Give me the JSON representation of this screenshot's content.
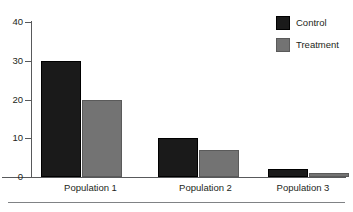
{
  "chart_data": {
    "type": "bar",
    "title": "",
    "subtitle": "",
    "xlabel": "",
    "ylabel": "",
    "categories": [
      "Population 1",
      "Population 2",
      "Population 3"
    ],
    "series": [
      {
        "name": "Control",
        "color": "#1a1a1a",
        "values": [
          30,
          10,
          2
        ]
      },
      {
        "name": "Treatment",
        "color": "#737373",
        "values": [
          20,
          7,
          1
        ]
      }
    ],
    "ylim": [
      0,
      40
    ],
    "yticks": [
      0,
      10,
      20,
      30,
      40
    ],
    "ytick_labels": [
      "0",
      "10",
      "20",
      "30",
      "40"
    ],
    "grid": false,
    "legend_position": "top-right",
    "annotations": []
  },
  "legend": {
    "entries": [
      {
        "label": "Control",
        "color": "#1a1a1a"
      },
      {
        "label": "Treatment",
        "color": "#737373"
      }
    ]
  },
  "axes": {
    "y_labels": [
      "40",
      "30",
      "20",
      "10",
      "0"
    ],
    "x_labels": [
      "Population 1",
      "Population 2",
      "Population 3"
    ]
  },
  "colors": {
    "background": "#ffffff",
    "axis": "#58595b",
    "text": "#231f20",
    "rule": "#808285",
    "control": "#1a1a1a",
    "treatment": "#737373"
  }
}
